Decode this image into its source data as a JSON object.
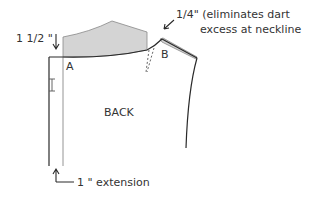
{
  "diagram": {
    "labels": {
      "measurement_top": "1 1/2 \"",
      "point_a": "A",
      "point_b": "B",
      "annotation_line1": "1/4\" (eliminates dart",
      "annotation_line2": "excess at neckline",
      "piece_name": "BACK",
      "extension": "1 \" extension"
    },
    "colors": {
      "line": "#2a2a2a",
      "fill": "#d4d4d4",
      "text": "#333333"
    }
  }
}
